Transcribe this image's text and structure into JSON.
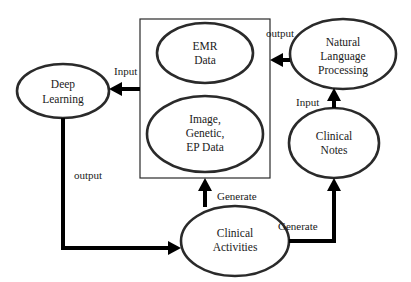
{
  "diagram": {
    "container": {
      "name": "Data Sources"
    },
    "nodes": {
      "emr": {
        "lines": [
          "EMR",
          "Data"
        ]
      },
      "image": {
        "lines": [
          "Image,",
          "Genetic,",
          "EP Data"
        ]
      },
      "deep_learning": {
        "lines": [
          "Deep",
          "Learning"
        ]
      },
      "nlp": {
        "lines": [
          "Natural",
          "Language",
          "Processing"
        ]
      },
      "clinical_notes": {
        "lines": [
          "Clinical",
          "Notes"
        ]
      },
      "clinical_activities": {
        "lines": [
          "Clinical",
          "Activities"
        ]
      }
    },
    "edges": {
      "box_to_dl": {
        "label": "Input"
      },
      "dl_to_activities": {
        "label": "output"
      },
      "nlp_to_box": {
        "label": "output"
      },
      "notes_to_nlp": {
        "label": "Input"
      },
      "activities_to_box": {
        "label": "Generate"
      },
      "activities_to_notes": {
        "label": "Generate"
      }
    },
    "colors": {
      "stroke": "#2a2a2a",
      "arrow": "#000000",
      "background": "#ffffff"
    }
  }
}
